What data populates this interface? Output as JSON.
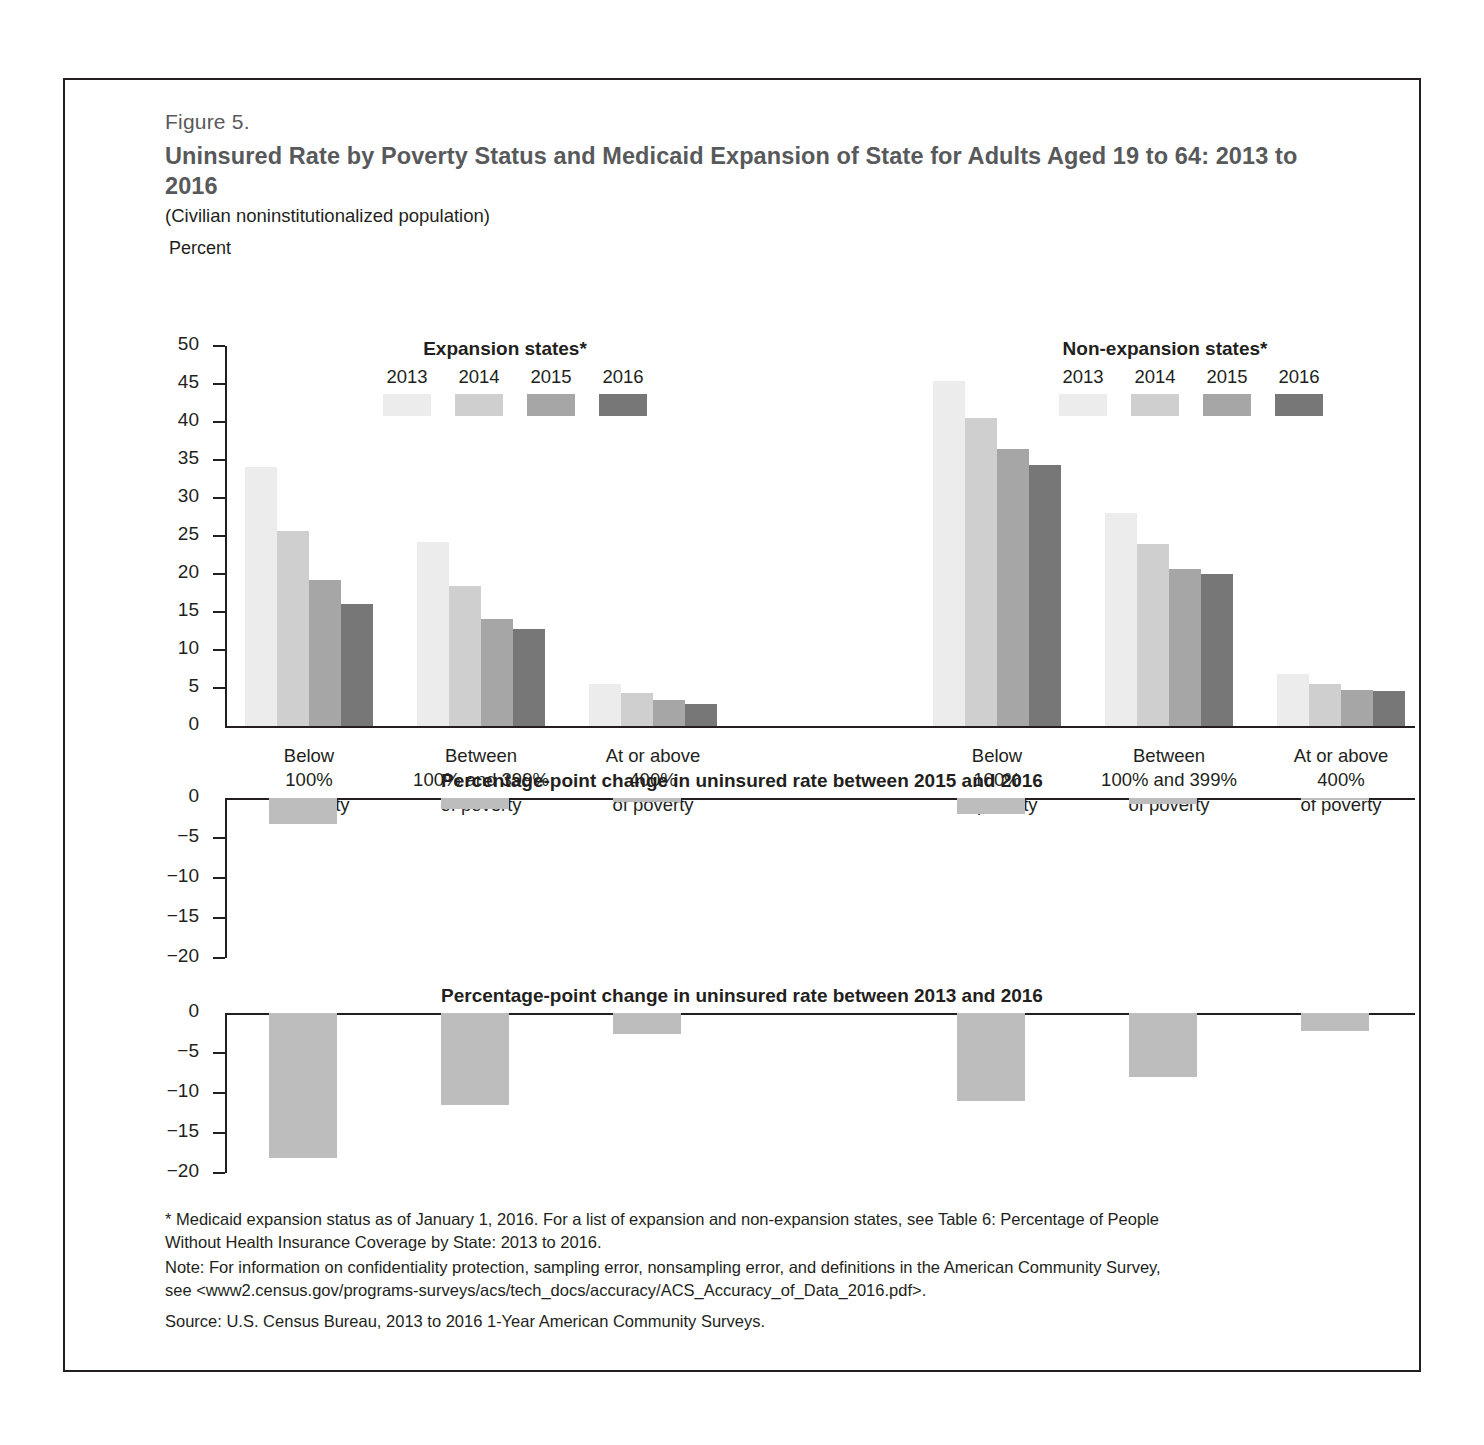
{
  "figure": {
    "number": "Figure 5.",
    "title": "Uninsured Rate by Poverty Status and Medicaid Expansion of State for Adults Aged 19 to 64: 2013 to 2016",
    "subtitle": "(Civilian noninstitutionalized population)",
    "axis_unit_label": "Percent"
  },
  "legends": {
    "left": {
      "title": "Expansion states*",
      "years": [
        "2013",
        "2014",
        "2015",
        "2016"
      ]
    },
    "right": {
      "title": "Non-expansion states*",
      "years": [
        "2013",
        "2014",
        "2015",
        "2016"
      ]
    }
  },
  "colors": {
    "y2013": "#ececec",
    "y2014": "#cfcfcf",
    "y2015": "#a6a6a6",
    "y2016": "#777777",
    "change_bar": "#bdbdbd",
    "axis": "#231f20",
    "title_gray": "#58595b"
  },
  "categories": [
    "Below\n100%\nof poverty",
    "Between\n100% and 399%\nof poverty",
    "At or above\n400%\nof poverty"
  ],
  "category_lines": [
    [
      "Below",
      "100%",
      "of poverty"
    ],
    [
      "Between",
      "100% and 399%",
      "of poverty"
    ],
    [
      "At or above",
      "400%",
      "of poverty"
    ]
  ],
  "panels": {
    "change_2015_2016": {
      "title": "Percentage-point change in uninsured rate between 2015 and 2016"
    },
    "change_2013_2016": {
      "title": "Percentage-point change in uninsured rate between 2013 and 2016"
    }
  },
  "footnotes": {
    "star_line1": "* Medicaid expansion status as of January 1, 2016. For a list of expansion and non-expansion states, see Table 6: Percentage of People",
    "star_line2": "Without Health Insurance Coverage by State: 2013 to 2016.",
    "note_line1": "Note: For information on confidentiality protection, sampling error, nonsampling error, and definitions in the American Community Survey,",
    "note_line2": "see <www2.census.gov/programs-surveys/acs/tech_docs/accuracy/ACS_Accuracy_of_Data_2016.pdf>.",
    "source": "Source: U.S. Census Bureau, 2013 to 2016 1-Year American Community Surveys."
  },
  "chart_data": [
    {
      "type": "bar",
      "title": "Uninsured Rate by Poverty Status and Medicaid Expansion of State for Adults Aged 19 to 64: 2013 to 2016",
      "subtitle": "(Civilian noninstitutionalized population)",
      "ylabel": "Percent",
      "xlabel": "",
      "ylim": [
        0,
        50
      ],
      "yticks": [
        0,
        5,
        10,
        15,
        20,
        25,
        30,
        35,
        40,
        45,
        50
      ],
      "ytick_labels": [
        "0",
        "5",
        "10",
        "15",
        "20",
        "25",
        "30",
        "35",
        "40",
        "45",
        "50"
      ],
      "grid": false,
      "legend_position": "top",
      "groups": [
        "Expansion states*",
        "Non-expansion states*"
      ],
      "categories": [
        "Below 100% of poverty",
        "Between 100% and 399% of poverty",
        "At or above 400% of poverty"
      ],
      "series": [
        {
          "name": "2013",
          "group": "Expansion states*",
          "values": [
            34.1,
            24.2,
            5.5
          ]
        },
        {
          "name": "2014",
          "group": "Expansion states*",
          "values": [
            25.7,
            18.4,
            4.3
          ]
        },
        {
          "name": "2015",
          "group": "Expansion states*",
          "values": [
            19.2,
            14.1,
            3.4
          ]
        },
        {
          "name": "2016",
          "group": "Expansion states*",
          "values": [
            16.0,
            12.7,
            2.9
          ]
        },
        {
          "name": "2013",
          "group": "Non-expansion states*",
          "values": [
            45.4,
            28.0,
            6.8
          ]
        },
        {
          "name": "2014",
          "group": "Non-expansion states*",
          "values": [
            40.5,
            23.9,
            5.5
          ]
        },
        {
          "name": "2015",
          "group": "Non-expansion states*",
          "values": [
            36.4,
            20.7,
            4.7
          ]
        },
        {
          "name": "2016",
          "group": "Non-expansion states*",
          "values": [
            34.4,
            20.0,
            4.6
          ]
        }
      ]
    },
    {
      "type": "bar",
      "title": "Percentage-point change in uninsured rate between 2015 and 2016",
      "ylim": [
        -20,
        0
      ],
      "yticks": [
        -20,
        -15,
        -10,
        -5,
        0
      ],
      "ytick_labels": [
        "−20",
        "−15",
        "−10",
        "−5",
        "0"
      ],
      "grid": false,
      "groups": [
        "Expansion states*",
        "Non-expansion states*"
      ],
      "categories": [
        "Below 100% of poverty",
        "Between 100% and 399% of poverty",
        "At or above 400% of poverty"
      ],
      "series": [
        {
          "name": "Expansion states*",
          "values": [
            -3.2,
            -1.4,
            -0.5
          ]
        },
        {
          "name": "Non-expansion states*",
          "values": [
            -2.0,
            -0.7,
            -0.1
          ]
        }
      ]
    },
    {
      "type": "bar",
      "title": "Percentage-point change in uninsured rate between 2013 and 2016",
      "ylim": [
        -20,
        0
      ],
      "yticks": [
        -20,
        -15,
        -10,
        -5,
        0
      ],
      "ytick_labels": [
        "−20",
        "−15",
        "−10",
        "−5",
        "0"
      ],
      "grid": false,
      "groups": [
        "Expansion states*",
        "Non-expansion states*"
      ],
      "categories": [
        "Below 100% of poverty",
        "Between 100% and 399% of poverty",
        "At or above 400% of poverty"
      ],
      "series": [
        {
          "name": "Expansion states*",
          "values": [
            -18.1,
            -11.5,
            -2.6
          ]
        },
        {
          "name": "Non-expansion states*",
          "values": [
            -11.0,
            -8.0,
            -2.2
          ]
        }
      ]
    }
  ]
}
